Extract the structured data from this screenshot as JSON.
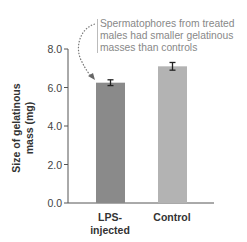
{
  "chart_data": {
    "type": "bar",
    "title": "",
    "xlabel": "",
    "ylabel": "Size of gelatinous mass (mg)",
    "ylabel_lines": [
      "Size of gelatinous",
      "mass (mg)"
    ],
    "categories": [
      "LPS-injected",
      "Control"
    ],
    "category_lines": [
      [
        "LPS-",
        "injected"
      ],
      [
        "Control"
      ]
    ],
    "values": [
      6.25,
      7.1
    ],
    "errors": [
      0.15,
      0.2
    ],
    "bar_colors": [
      "#8a8a8a",
      "#b3b3b3"
    ],
    "ylim": [
      0,
      8
    ],
    "yticks": [
      "0.0",
      "2.0",
      "4.0",
      "6.0",
      "8.0"
    ],
    "grid": false,
    "legend": null,
    "annotations": [
      {
        "text_lines": [
          "Spermatophores from treated",
          "males had smaller gelatinous",
          "masses than controls"
        ],
        "points_to": "LPS-injected",
        "style": "dotted curved arrow"
      }
    ]
  }
}
